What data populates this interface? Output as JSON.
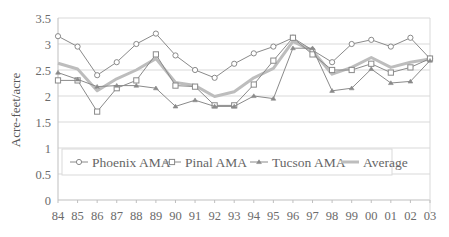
{
  "chart_data": {
    "type": "line",
    "title": "",
    "xlabel": "",
    "ylabel": "Acre-feet/acre",
    "ylim": [
      0,
      3.5
    ],
    "yticks": [
      "0",
      "0.5",
      "1",
      "1.5",
      "2",
      "2.5",
      "3",
      "3.5"
    ],
    "ytick_values": [
      0,
      0.5,
      1,
      1.5,
      2,
      2.5,
      3,
      3.5
    ],
    "grid": true,
    "legend_position": "inside-lower-center",
    "categories": [
      "84",
      "85",
      "86",
      "87",
      "88",
      "89",
      "90",
      "91",
      "92",
      "93",
      "94",
      "95",
      "96",
      "97",
      "98",
      "99",
      "00",
      "01",
      "02",
      "03"
    ],
    "series": [
      {
        "name": "Phoenix AMA",
        "marker": "circle",
        "color": "#8a8a8a",
        "width": 1,
        "values": [
          3.15,
          2.95,
          2.4,
          2.65,
          3.0,
          3.2,
          2.78,
          2.5,
          2.35,
          2.62,
          2.82,
          2.95,
          3.12,
          2.88,
          2.65,
          3.0,
          3.08,
          2.95,
          3.12,
          2.72
        ]
      },
      {
        "name": "Pinal AMA",
        "marker": "square",
        "color": "#8a8a8a",
        "width": 1,
        "values": [
          2.3,
          2.3,
          1.7,
          2.15,
          2.3,
          2.8,
          2.2,
          2.18,
          1.82,
          1.82,
          2.22,
          2.68,
          3.12,
          2.8,
          2.5,
          2.5,
          2.62,
          2.45,
          2.55,
          2.72
        ]
      },
      {
        "name": "Tucson AMA",
        "marker": "triangle",
        "color": "#8a8a8a",
        "width": 1,
        "values": [
          2.45,
          2.32,
          2.18,
          2.2,
          2.2,
          2.15,
          1.8,
          1.92,
          1.8,
          1.8,
          2.0,
          1.95,
          2.92,
          2.92,
          2.1,
          2.15,
          2.52,
          2.25,
          2.28,
          2.68
        ]
      },
      {
        "name": "Average",
        "marker": "none",
        "color": "#bdbdbd",
        "width": 3,
        "values": [
          2.63,
          2.52,
          2.1,
          2.33,
          2.5,
          2.72,
          2.26,
          2.2,
          1.99,
          2.08,
          2.35,
          2.53,
          3.05,
          2.87,
          2.42,
          2.55,
          2.74,
          2.55,
          2.65,
          2.71
        ]
      }
    ]
  },
  "legend": {
    "items": [
      {
        "label": "Phoenix AMA"
      },
      {
        "label": "Pinal AMA"
      },
      {
        "label": "Tucson AMA"
      },
      {
        "label": "Average"
      }
    ]
  },
  "colors": {
    "gridline": "#d9d9d9",
    "axis": "#bfbfbf",
    "series_line": "#8a8a8a",
    "average_line": "#bdbdbd",
    "text": "#6b6b6b"
  }
}
